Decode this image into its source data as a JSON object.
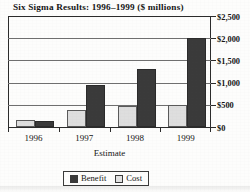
{
  "chart_data": {
    "type": "bar",
    "title": "Six Sigma Results: 1996–1999 ($ millions)",
    "xlabel": "Estimate",
    "ylabel": "",
    "categories": [
      "1996",
      "1997",
      "1998",
      "1999"
    ],
    "series": [
      {
        "name": "Cost",
        "color": "#dedede",
        "values": [
          150,
          380,
          480,
          500
        ]
      },
      {
        "name": "Benefit",
        "color": "#3a3a3a",
        "values": [
          130,
          950,
          1300,
          2000
        ]
      }
    ],
    "ylim": [
      0,
      2500
    ],
    "yticks": [
      0,
      500,
      1000,
      1500,
      2000,
      2500
    ],
    "ytick_labels": [
      "$0",
      "$500",
      "$1,000",
      "$1,500",
      "$2,000",
      "$2,500"
    ],
    "grid": true,
    "y_axis_position": "right",
    "legend_position": "bottom",
    "legend": [
      "Benefit",
      "Cost"
    ]
  },
  "legend": {
    "entries": [
      {
        "label": "Benefit",
        "swatch": "benefit-swatch"
      },
      {
        "label": "Cost",
        "swatch": "cost-swatch"
      }
    ]
  }
}
